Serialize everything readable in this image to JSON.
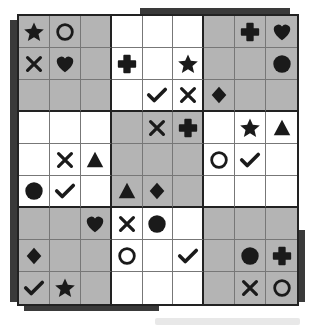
{
  "puzzle": {
    "type": "symbol-sudoku",
    "size": 9,
    "box_size": 3,
    "shaded_color": "#b4b4b4",
    "symbol_color": "#1a1a1a",
    "shaded_boxes": [
      [
        0,
        0
      ],
      [
        0,
        2
      ],
      [
        1,
        1
      ],
      [
        2,
        0
      ],
      [
        2,
        2
      ]
    ],
    "symbols_legend": [
      "star",
      "circle",
      "cross",
      "heart",
      "plus",
      "check",
      "diamond",
      "triangle",
      "dot"
    ],
    "grid": [
      [
        "star",
        "circle",
        "",
        "",
        "",
        "",
        "",
        "plus",
        "heart"
      ],
      [
        "cross",
        "heart",
        "",
        "plus",
        "",
        "star",
        "",
        "",
        "dot"
      ],
      [
        "",
        "",
        "",
        "",
        "check",
        "cross",
        "diamond",
        "",
        ""
      ],
      [
        "",
        "",
        "",
        "",
        "cross",
        "plus",
        "",
        "star",
        "triangle"
      ],
      [
        "",
        "cross",
        "triangle",
        "",
        "",
        "",
        "circle",
        "check",
        ""
      ],
      [
        "dot",
        "check",
        "",
        "triangle",
        "diamond",
        "",
        "",
        "",
        ""
      ],
      [
        "",
        "",
        "heart",
        "cross",
        "dot",
        "",
        "",
        "",
        ""
      ],
      [
        "diamond",
        "",
        "",
        "circle",
        "",
        "check",
        "",
        "dot",
        "plus"
      ],
      [
        "check",
        "star",
        "",
        "",
        "",
        "",
        "",
        "cross",
        "circle"
      ]
    ]
  }
}
